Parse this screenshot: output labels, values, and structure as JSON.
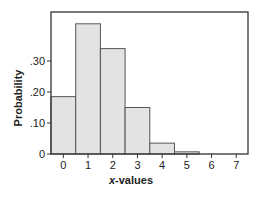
{
  "chart_data": {
    "type": "bar",
    "title": "",
    "xlabel_prefix": "x",
    "xlabel_suffix": "-values",
    "xlabel": "x-values",
    "ylabel": "Probability",
    "categories": [
      "0",
      "1",
      "2",
      "3",
      "4",
      "5",
      "6",
      "7"
    ],
    "values": [
      0.185,
      0.42,
      0.34,
      0.15,
      0.035,
      0.007,
      0.0,
      0.0
    ],
    "yticks": [
      0,
      0.1,
      0.2,
      0.3
    ],
    "ytick_labels": [
      "0",
      ".10",
      ".20",
      ".30"
    ],
    "ylim": [
      0,
      0.46
    ],
    "grid": false,
    "legend": null,
    "bar_fill": "#e3e3e3",
    "bar_stroke": "#555555"
  }
}
